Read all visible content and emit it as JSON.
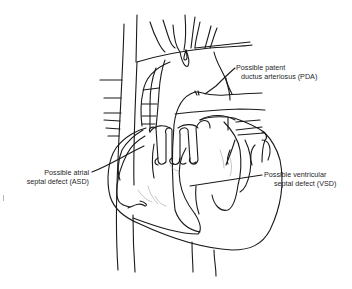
{
  "figure": {
    "line_color": "#1a1a1a",
    "background": "#ffffff"
  },
  "labels": {
    "pda": {
      "line1": "Possible patent",
      "line2": "ductus arteriosus (PDA)"
    },
    "asd": {
      "line1": "Possible atrial",
      "line2": "septal defect (ASD)"
    },
    "vsd": {
      "line1": "Possible ventricular",
      "line2": "septal defect (VSD)"
    }
  }
}
